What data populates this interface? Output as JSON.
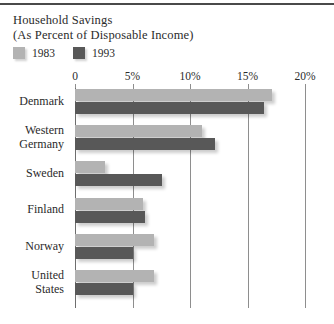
{
  "header": {
    "title_line1": "Household Savings",
    "title_line2": "(As Percent of Disposable Income)"
  },
  "legend": {
    "entries": [
      {
        "label": "1983",
        "color": "#b3b3b3",
        "icon": "legend-swatch-icon"
      },
      {
        "label": "1993",
        "color": "#585858",
        "icon": "legend-swatch-icon"
      }
    ]
  },
  "colors": {
    "series_1983": "#b3b3b3",
    "series_1993": "#585858",
    "gridline": "#8e8e8e",
    "axis": "#6e6e6e",
    "text": "#2b2b2b",
    "top_rule": "#4a4a4a",
    "background": "#ffffff"
  },
  "chart_data": {
    "type": "bar",
    "orientation": "horizontal",
    "title": "Household Savings (As Percent of Disposable Income)",
    "xlabel": "",
    "ylabel": "",
    "xlim": [
      0,
      20
    ],
    "xticks": [
      0,
      5,
      10,
      15,
      20
    ],
    "xticklabels": [
      "0",
      "5%",
      "10%",
      "15%",
      "20%"
    ],
    "grid": true,
    "legend_position": "top-left",
    "categories": [
      "Denmark",
      "Western Germany",
      "Sweden",
      "Finland",
      "Norway",
      "United States"
    ],
    "category_label_lines": [
      [
        "Denmark"
      ],
      [
        "Western",
        "Germany"
      ],
      [
        "Sweden"
      ],
      [
        "Finland"
      ],
      [
        "Norway"
      ],
      [
        "United",
        "States"
      ]
    ],
    "series": [
      {
        "name": "1983",
        "color": "#b3b3b3",
        "values": [
          17.1,
          11.0,
          2.6,
          5.9,
          6.9,
          6.9
        ]
      },
      {
        "name": "1993",
        "color": "#585858",
        "values": [
          16.4,
          12.2,
          7.6,
          6.1,
          5.0,
          5.0
        ]
      }
    ]
  }
}
